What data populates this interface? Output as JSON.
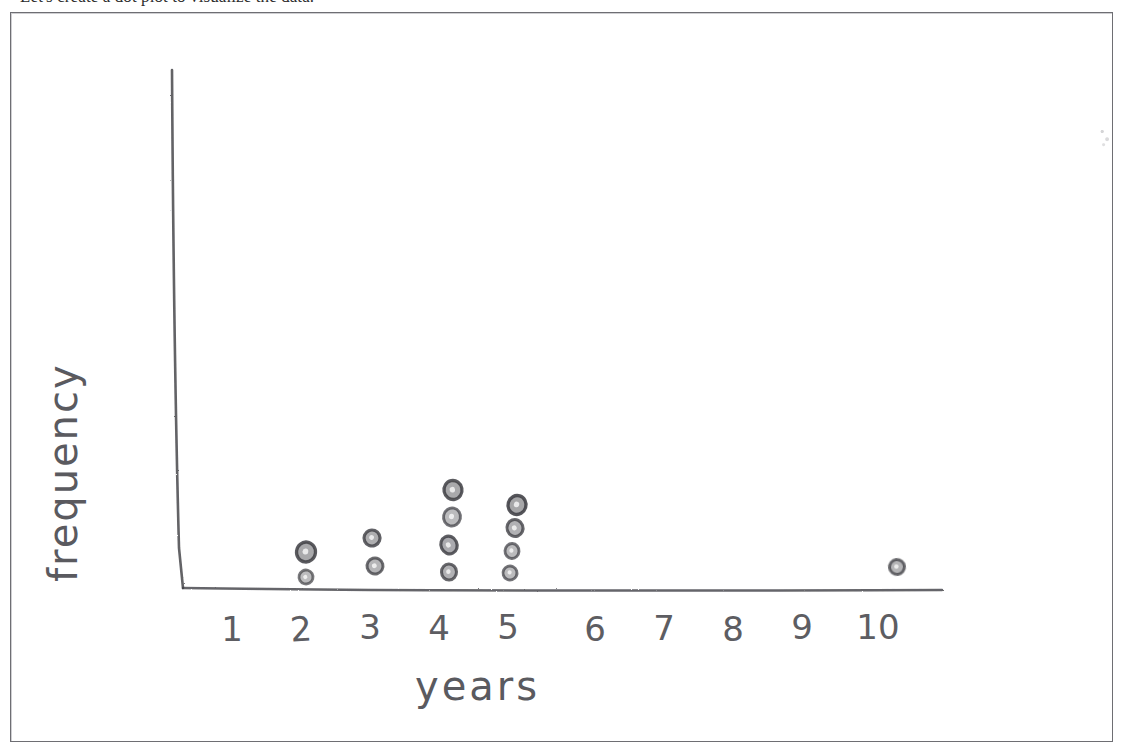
{
  "prompt": {
    "text": "Let's create a dot plot to visualize the data."
  },
  "plot": {
    "x_axis_title": "years",
    "y_axis_title": "frequency"
  },
  "colors": {
    "paper": "#ffffff",
    "frame": "#6e6e73",
    "pencil": "#5a5a5f",
    "pencil_dark": "#3f3f44",
    "print_ink": "#2b2b2b"
  },
  "chart_data": {
    "type": "scatter",
    "subtype": "dot-plot",
    "title": "",
    "xlabel": "years",
    "ylabel": "frequency",
    "categories": [
      "1",
      "2",
      "3",
      "4",
      "5",
      "6",
      "7",
      "8",
      "9",
      "10"
    ],
    "values": [
      0,
      2,
      2,
      4,
      4,
      0,
      0,
      0,
      0,
      1
    ],
    "xlim": [
      1,
      10
    ],
    "ylim": [
      0,
      4
    ],
    "grid": false,
    "legend": null,
    "dots": [
      {
        "category": "2",
        "stack_index": 1,
        "cx": 306,
        "cy": 577,
        "rx": 7,
        "ry": 7,
        "tone": 0.55
      },
      {
        "category": "2",
        "stack_index": 2,
        "cx": 306,
        "cy": 552,
        "rx": 9.5,
        "ry": 10,
        "tone": 0.9
      },
      {
        "category": "3",
        "stack_index": 1,
        "cx": 375,
        "cy": 566,
        "rx": 8,
        "ry": 8,
        "tone": 0.7
      },
      {
        "category": "3",
        "stack_index": 2,
        "cx": 372,
        "cy": 538,
        "rx": 8,
        "ry": 8,
        "tone": 0.8
      },
      {
        "category": "4",
        "stack_index": 1,
        "cx": 449,
        "cy": 572,
        "rx": 7.5,
        "ry": 8,
        "tone": 0.75
      },
      {
        "category": "4",
        "stack_index": 2,
        "cx": 449,
        "cy": 545,
        "rx": 8,
        "ry": 9,
        "tone": 0.85
      },
      {
        "category": "4",
        "stack_index": 3,
        "cx": 452,
        "cy": 517,
        "rx": 8.5,
        "ry": 9,
        "tone": 0.6
      },
      {
        "category": "4",
        "stack_index": 4,
        "cx": 453,
        "cy": 490,
        "rx": 9,
        "ry": 9.5,
        "tone": 0.9
      },
      {
        "category": "5",
        "stack_index": 1,
        "cx": 510,
        "cy": 573,
        "rx": 7,
        "ry": 7,
        "tone": 0.6
      },
      {
        "category": "5",
        "stack_index": 2,
        "cx": 512,
        "cy": 551,
        "rx": 7,
        "ry": 7.5,
        "tone": 0.6
      },
      {
        "category": "5",
        "stack_index": 3,
        "cx": 515,
        "cy": 528,
        "rx": 8,
        "ry": 8.5,
        "tone": 0.75
      },
      {
        "category": "5",
        "stack_index": 4,
        "cx": 517,
        "cy": 505,
        "rx": 9,
        "ry": 9.5,
        "tone": 0.95
      },
      {
        "category": "10",
        "stack_index": 1,
        "cx": 897,
        "cy": 567,
        "rx": 7.5,
        "ry": 7.5,
        "tone": 0.7
      }
    ],
    "tick_positions": [
      {
        "label": "1",
        "x": 232,
        "y": 612,
        "rotate": 0
      },
      {
        "label": "2",
        "x": 301,
        "y": 612,
        "rotate": -4
      },
      {
        "label": "3",
        "x": 370,
        "y": 610,
        "rotate": 0
      },
      {
        "label": "4",
        "x": 439,
        "y": 611,
        "rotate": 0
      },
      {
        "label": "5",
        "x": 508,
        "y": 610,
        "rotate": 0
      },
      {
        "label": "6",
        "x": 595,
        "y": 612,
        "rotate": 0
      },
      {
        "label": "7",
        "x": 664,
        "y": 611,
        "rotate": 0
      },
      {
        "label": "8",
        "x": 733,
        "y": 612,
        "rotate": 0
      },
      {
        "label": "9",
        "x": 802,
        "y": 610,
        "rotate": 0
      },
      {
        "label": "10",
        "x": 878,
        "y": 610,
        "rotate": 0
      }
    ],
    "axes": {
      "y_axis": {
        "x_top": 172,
        "y_top": 70,
        "x_bottom": 183,
        "y_bottom": 588
      },
      "x_axis": {
        "x_left": 183,
        "y_left": 588,
        "x_right": 942,
        "y_right": 590
      }
    }
  }
}
